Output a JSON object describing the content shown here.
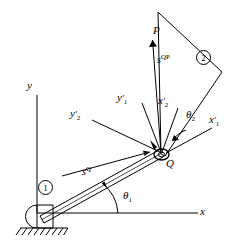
{
  "figure": {
    "type": "kinematic-linkage-diagram",
    "line_color": "#000000",
    "background": "#ffffff"
  },
  "global_frame": {
    "x_axis_label": "x",
    "y_axis_label": "y",
    "origin_note": "ground pivot"
  },
  "bodies": [
    {
      "id": "1",
      "label": "1",
      "name": "link-one"
    },
    {
      "id": "2",
      "label": "2",
      "name": "body-two"
    }
  ],
  "points": {
    "joint": "Q",
    "tip": "P"
  },
  "vectors": [
    {
      "name": "s-Q",
      "base": "s",
      "sup": "Q",
      "label_text": "s"
    },
    {
      "name": "s-QP",
      "base": "s",
      "sup": "QP",
      "label_text": "s"
    }
  ],
  "axes_labels": {
    "x1_prime": {
      "base": "x",
      "sub": "1"
    },
    "x2_prime": {
      "base": "x",
      "sub": "2"
    },
    "y1_prime": {
      "base": "y",
      "sub": "1"
    },
    "y2_prime": {
      "base": "y",
      "sub": "2"
    }
  },
  "angles": [
    {
      "name": "theta-1",
      "symbol": "θ",
      "sub": "1"
    },
    {
      "name": "theta-2",
      "symbol": "θ",
      "sub": "2"
    }
  ]
}
